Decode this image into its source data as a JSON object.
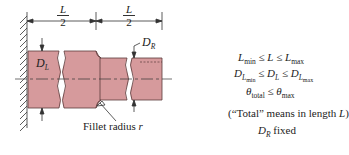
{
  "diagram": {
    "dimensions": {
      "left_half": {
        "numerator": "L",
        "denominator": "2"
      },
      "right_half": {
        "numerator": "L",
        "denominator": "2"
      }
    },
    "labels": {
      "left_diameter": {
        "main": "D",
        "sub": "L"
      },
      "right_diameter": {
        "main": "D",
        "sub": "R"
      },
      "fillet": {
        "text": "Fillet radius ",
        "var": "r"
      }
    },
    "constraints": [
      {
        "id": "length",
        "parts": [
          "L",
          "min",
          "≤",
          "L",
          "≤",
          "L",
          "max"
        ]
      },
      {
        "id": "diameter",
        "parts": [
          "D",
          "L",
          "min",
          "≤",
          "D",
          "L",
          "≤",
          "D",
          "L",
          "max"
        ]
      },
      {
        "id": "twist",
        "parts": [
          "θ",
          "total",
          "≤",
          "θ",
          "max"
        ]
      }
    ],
    "note": {
      "prefix": "(“Total” means in length ",
      "var": "L",
      "suffix": ")"
    },
    "fixed": {
      "main": "D",
      "sub": "R",
      "text": "fixed"
    },
    "colors": {
      "shaft_fill": "#d69a9c",
      "shaft_stroke": "#5a3a3a",
      "line": "#333333"
    }
  }
}
